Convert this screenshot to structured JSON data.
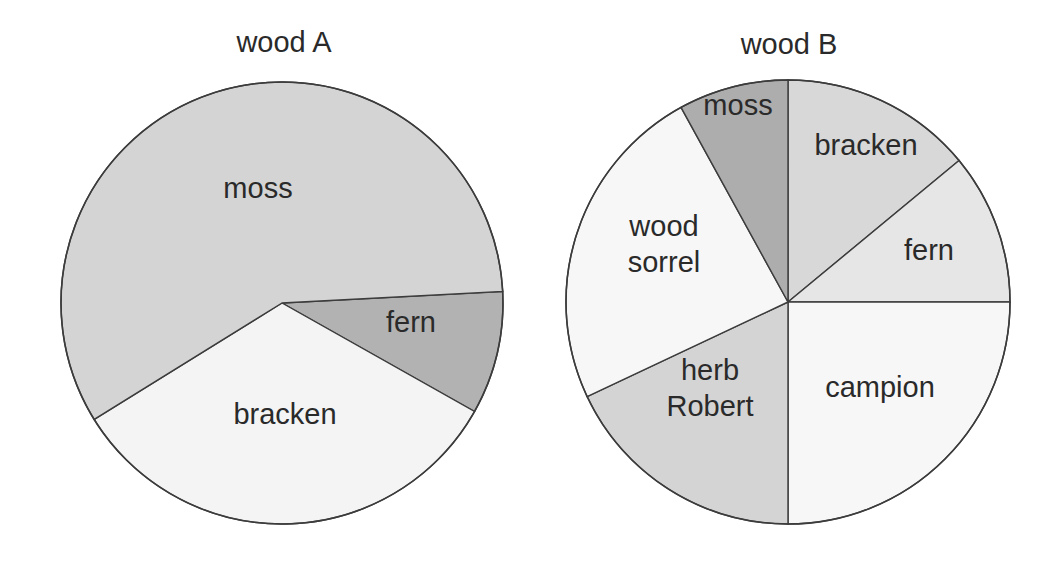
{
  "chart_data": [
    {
      "type": "pie",
      "title": "wood A",
      "center": [
        282,
        303
      ],
      "radius": 221,
      "start_angle_deg": -3,
      "direction": "clockwise",
      "slices": [
        {
          "label": "fern",
          "value": 9,
          "color": "#b2b2b2",
          "label_pos": [
            411,
            332
          ],
          "lines": [
            "fern"
          ]
        },
        {
          "label": "bracken",
          "value": 33,
          "color": "#f4f4f4",
          "label_pos": [
            285,
            424
          ],
          "lines": [
            "bracken"
          ]
        },
        {
          "label": "moss",
          "value": 58,
          "color": "#d4d4d4",
          "label_pos": [
            258,
            198
          ],
          "lines": [
            "moss"
          ]
        }
      ]
    },
    {
      "type": "pie",
      "title": "wood B",
      "center": [
        788,
        302
      ],
      "radius": 222,
      "start_angle_deg": -90,
      "direction": "clockwise",
      "slices": [
        {
          "label": "bracken",
          "value": 14,
          "color": "#d8d8d8",
          "label_pos": [
            866,
            155
          ],
          "lines": [
            "bracken"
          ]
        },
        {
          "label": "fern",
          "value": 11,
          "color": "#e6e6e6",
          "label_pos": [
            929,
            260
          ],
          "lines": [
            "fern"
          ]
        },
        {
          "label": "campion",
          "value": 25,
          "color": "#f7f7f7",
          "label_pos": [
            880,
            397
          ],
          "lines": [
            "campion"
          ]
        },
        {
          "label": "herb Robert",
          "value": 18,
          "color": "#d4d4d4",
          "label_pos": [
            710,
            380
          ],
          "lines": [
            "herb",
            "Robert"
          ]
        },
        {
          "label": "wood sorrel",
          "value": 24,
          "color": "#f7f7f7",
          "label_pos": [
            664,
            236
          ],
          "lines": [
            "wood",
            "sorrel"
          ]
        },
        {
          "label": "moss",
          "value": 8,
          "color": "#adadad",
          "label_pos": [
            738,
            115
          ],
          "lines": [
            "moss"
          ]
        }
      ]
    }
  ],
  "titles": {
    "wood_a": "wood A",
    "wood_b": "wood B"
  },
  "title_positions": {
    "wood_a": [
      284,
      52
    ],
    "wood_b": [
      789,
      54
    ]
  }
}
